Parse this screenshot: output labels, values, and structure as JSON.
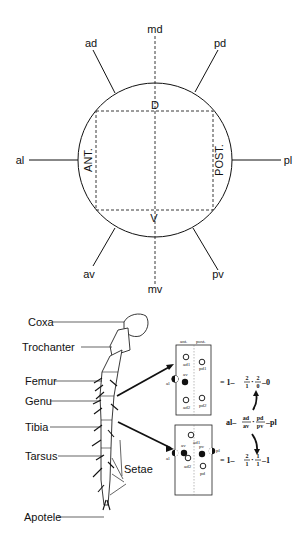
{
  "figure": {
    "orientation_diagram": {
      "outer_labels": {
        "md": "md",
        "ad": "ad",
        "pd": "pd",
        "al": "al",
        "pl": "pl",
        "av": "av",
        "mv": "mv",
        "pv": "pv"
      },
      "inner_labels": {
        "dorsal": "D",
        "ventral": "V",
        "anterior": "ANT.",
        "posterior": "POST."
      }
    },
    "leg_diagram": {
      "segments": [
        "Coxa",
        "Trochanter",
        "Femur",
        "Genu",
        "Tibia",
        "Tarsus",
        "Apotele"
      ],
      "setae_label": "Setae"
    },
    "setae_boxes": [
      {
        "header_left": "ant.",
        "header_right": "post.",
        "setae": {
          "ad1": "ad1",
          "pd1": "pd1",
          "av": "av",
          "al": "al",
          "ad2": "ad2",
          "pd2": "pd2"
        },
        "equation": {
          "prefix": "= 1–",
          "frac1_num": "2",
          "frac1_den": "1",
          "frac2_num": "2",
          "frac2_den": "0",
          "suffix": "–0"
        }
      },
      {
        "setae": {
          "ad1": "ad1",
          "av": "av",
          "pv": "pv",
          "al": "al",
          "pl": "pl",
          "ad2": "ad2",
          "pd": "pd"
        },
        "equation": {
          "prefix": "= 1–",
          "frac1_num": "2",
          "frac1_den": "1",
          "frac2_num": "1",
          "frac2_den": "1",
          "suffix": "–1"
        }
      }
    ],
    "general_formula": {
      "prefix": "al–",
      "frac1_num": "ad",
      "frac1_den": "av",
      "frac2_num": "pd",
      "frac2_den": "pv",
      "suffix": "–pl"
    }
  }
}
